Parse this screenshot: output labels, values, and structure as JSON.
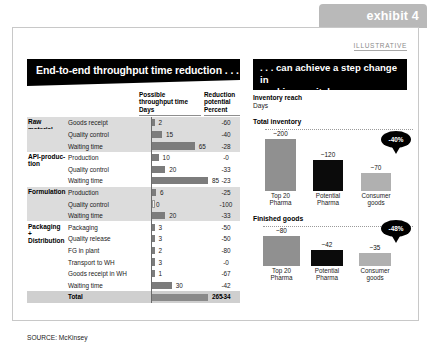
{
  "exhibit": {
    "tab_label": "exhibit 4",
    "illustrative": "ILLUSTRATIVE"
  },
  "left": {
    "title": "End-to-end throughput time reduction . . .",
    "headers": {
      "col2_line1": "Possible",
      "col2_line2": "throughput time",
      "col2_unit": "Days",
      "col3_line1": "Reduction",
      "col3_line2": "potential",
      "col3_unit": "Percent"
    },
    "rows": [
      {
        "group": "Raw material supply",
        "activity": "Goods receipt",
        "days": 2,
        "reduction": "-60",
        "band": true
      },
      {
        "group": "",
        "activity": "Quality control",
        "days": 15,
        "reduction": "-40",
        "band": true
      },
      {
        "group": "",
        "activity": "Waiting time",
        "days": 65,
        "reduction": "-28",
        "band": true
      },
      {
        "group": "API-produc-tion",
        "activity": "Production",
        "days": 10,
        "reduction": "-0",
        "band": false
      },
      {
        "group": "",
        "activity": "Quality control",
        "days": 20,
        "reduction": "-33",
        "band": false
      },
      {
        "group": "",
        "activity": "Waiting time",
        "days": 85,
        "reduction": "-23",
        "band": false
      },
      {
        "group": "Formulation",
        "activity": "Production",
        "days": 6,
        "reduction": "-25",
        "band": true
      },
      {
        "group": "",
        "activity": "Quality control",
        "days": 0,
        "reduction": "-100",
        "band": true
      },
      {
        "group": "",
        "activity": "Waiting time",
        "days": 20,
        "reduction": "-33",
        "band": true
      },
      {
        "group": "Packaging + Distribution",
        "activity": "Packaging",
        "days": 3,
        "reduction": "-50",
        "band": false
      },
      {
        "group": "",
        "activity": "Quality release",
        "days": 3,
        "reduction": "-50",
        "band": false
      },
      {
        "group": "",
        "activity": "FG in plant",
        "days": 2,
        "reduction": "-80",
        "band": false
      },
      {
        "group": "",
        "activity": "Transport to WH",
        "days": 3,
        "reduction": "-0",
        "band": false
      },
      {
        "group": "",
        "activity": "Goods receipt in WH",
        "days": 1,
        "reduction": "-67",
        "band": false
      },
      {
        "group": "",
        "activity": "Waiting time",
        "days": 30,
        "reduction": "-42",
        "band": false
      }
    ],
    "total": {
      "activity": "Total",
      "days": 265,
      "reduction": "-34"
    },
    "source": "SOURCE:  McKinsey"
  },
  "right": {
    "title_line1": ". . . can achieve a step change in",
    "title_line2": "working capital",
    "metric_label": "Inventory reach",
    "metric_unit": "Days"
  },
  "chart_data": [
    {
      "type": "bar",
      "title": "Total inventory",
      "categories": [
        "Top 20 Pharma",
        "Potential Pharma",
        "Consumer goods"
      ],
      "values": [
        200,
        120,
        70
      ],
      "value_labels": [
        "~200",
        "~120",
        "~70"
      ],
      "colors": [
        "#909090",
        "#0b0b0b",
        "#b0b0b0"
      ],
      "annotation": "-40%",
      "xlabel": "",
      "ylabel": "Days",
      "ylim": [
        0,
        200
      ],
      "grid": false
    },
    {
      "type": "bar",
      "title": "Finished goods",
      "categories": [
        "Top 20 Pharma",
        "Potential Pharma",
        "Consumer goods"
      ],
      "values": [
        80,
        42,
        35
      ],
      "value_labels": [
        "~80",
        "~42",
        "~35"
      ],
      "colors": [
        "#909090",
        "#0b0b0b",
        "#b0b0b0"
      ],
      "annotation": "-48%",
      "xlabel": "",
      "ylabel": "Days",
      "ylim": [
        0,
        80
      ],
      "grid": false
    }
  ]
}
